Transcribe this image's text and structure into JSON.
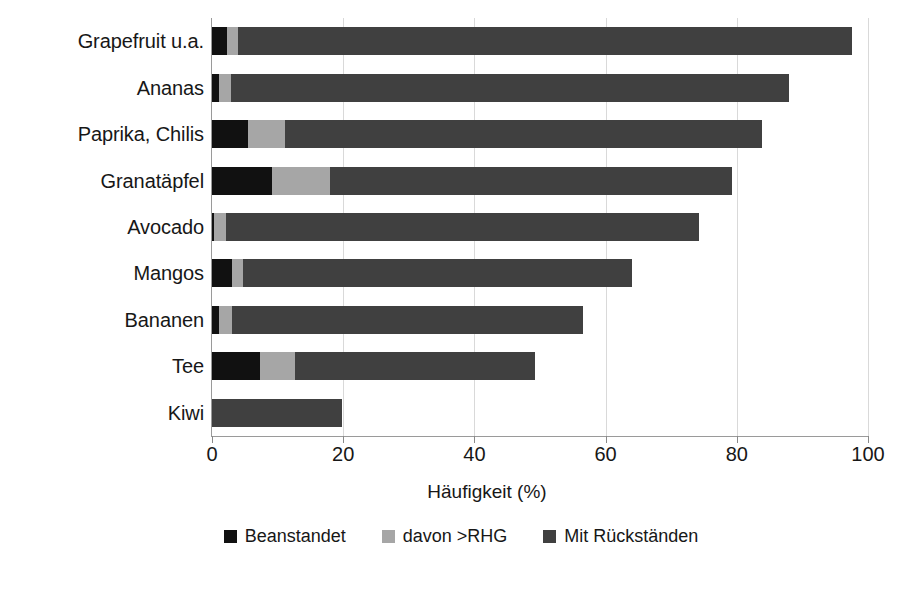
{
  "chart_data": {
    "type": "bar",
    "orientation": "horizontal",
    "stacked": true,
    "title": "",
    "xlabel": "Häufigkeit (%)",
    "ylabel": "",
    "xlim": [
      0,
      100
    ],
    "xticks": [
      0,
      20,
      40,
      60,
      80,
      100
    ],
    "xtick_labels": [
      "0",
      "20",
      "40",
      "60",
      "80",
      "100"
    ],
    "grid": true,
    "grid_axis": "x",
    "legend_position": "bottom",
    "categories": [
      "Grapefruit u.a.",
      "Ananas",
      "Paprika, Chilis",
      "Granatäpfel",
      "Avocado",
      "Mangos",
      "Bananen",
      "Tee",
      "Kiwi"
    ],
    "series": [
      {
        "name": "Beanstandet",
        "color": "#111111",
        "values": [
          2.3,
          1.0,
          5.5,
          9.2,
          0.3,
          3.1,
          1.0,
          7.3,
          0.0
        ]
      },
      {
        "name": "davon >RHG",
        "color": "#a6a6a6",
        "values": [
          1.7,
          1.9,
          5.6,
          8.8,
          1.9,
          1.6,
          2.1,
          5.4,
          0.0
        ]
      },
      {
        "name": "Mit Rückständen",
        "color": "#404040",
        "values": [
          93.5,
          85.0,
          72.7,
          61.3,
          72.0,
          59.3,
          53.4,
          36.5,
          19.8
        ]
      }
    ],
    "totals": [
      97.5,
      87.9,
      83.8,
      79.3,
      74.2,
      64.0,
      56.5,
      49.2,
      19.8
    ]
  },
  "legend": {
    "items": [
      {
        "label": "Beanstandet",
        "color": "#111111",
        "swatch_name": "legend-swatch-beanstandet"
      },
      {
        "label": "davon >RHG",
        "color": "#a6a6a6",
        "swatch_name": "legend-swatch-davon-rhg"
      },
      {
        "label": "Mit Rückständen",
        "color": "#404040",
        "swatch_name": "legend-swatch-mit-rueckstaenden"
      }
    ]
  },
  "colors": {
    "beanstandet": "#111111",
    "davon_rhg": "#a6a6a6",
    "mit_rueckstaenden": "#404040",
    "gridline": "#d9d9d9",
    "axis": "#9a9a9a",
    "text": "#171717",
    "background": "#ffffff"
  }
}
